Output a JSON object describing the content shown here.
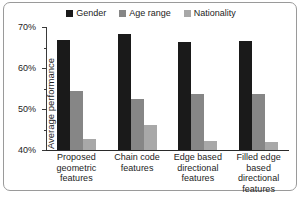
{
  "chart_data": {
    "type": "bar",
    "title": "",
    "xlabel": "",
    "ylabel": "Average performance",
    "ylim": [
      40,
      70
    ],
    "ytick_labels": [
      "40%",
      "50%",
      "60%",
      "70%"
    ],
    "ytick_values": [
      40,
      50,
      60,
      70
    ],
    "yminor_values": [
      45,
      55,
      65
    ],
    "grid": false,
    "legend_position": "top-center",
    "categories": [
      "Proposed geometric features",
      "Chain code features",
      "Edge based directional features",
      "Filled edge based directional features"
    ],
    "series": [
      {
        "name": "Gender",
        "color": "#1a1a1a",
        "values": [
          66.8,
          68.3,
          66.3,
          66.6
        ]
      },
      {
        "name": "Age range",
        "color": "#868686",
        "values": [
          54.4,
          52.4,
          53.7,
          53.6
        ]
      },
      {
        "name": "Nationality",
        "color": "#a8a8a8",
        "values": [
          42.8,
          46.0,
          42.2,
          42.0
        ]
      }
    ]
  },
  "legend": {
    "items": [
      {
        "label": "Gender",
        "color": "#1a1a1a"
      },
      {
        "label": "Age range",
        "color": "#868686"
      },
      {
        "label": "Nationality",
        "color": "#a8a8a8"
      }
    ]
  }
}
